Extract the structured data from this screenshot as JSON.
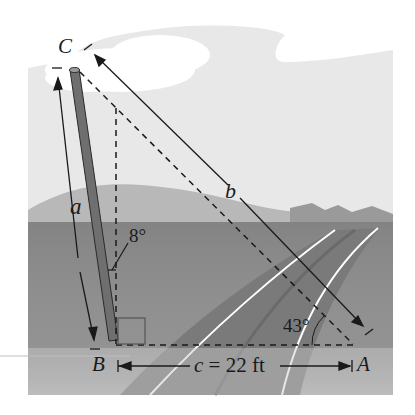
{
  "diagram": {
    "type": "trigonometry-figure",
    "vertices": {
      "C": "C",
      "B": "B",
      "A": "A"
    },
    "sides": {
      "a": "a",
      "b": "b",
      "c_label": "c = 22 ft"
    },
    "angles": {
      "lean_angle": "8°",
      "angle_at_A": "43°"
    },
    "colors": {
      "sky": "#ffffff",
      "cloud_backdrop": "#e9e9e9",
      "hills_light": "#bdbdbd",
      "ground": "#8f8f8f",
      "road": "#7a7a7a",
      "pole": "#6e6e6e",
      "line": "#1a1a1a"
    }
  }
}
